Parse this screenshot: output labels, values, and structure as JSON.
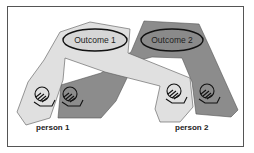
{
  "diagram": {
    "outcomes": [
      {
        "label": "Outcome 1",
        "fill": "#d9d9d9"
      },
      {
        "label": "Outcome 2",
        "fill": "#8a8a8a"
      }
    ],
    "persons": [
      {
        "label": "person 1"
      },
      {
        "label": "person 2"
      }
    ],
    "colors": {
      "light_region": "#e0e0e0",
      "dark_region": "#8c8c8c",
      "outline": "#333333",
      "frame": "#555555"
    }
  }
}
